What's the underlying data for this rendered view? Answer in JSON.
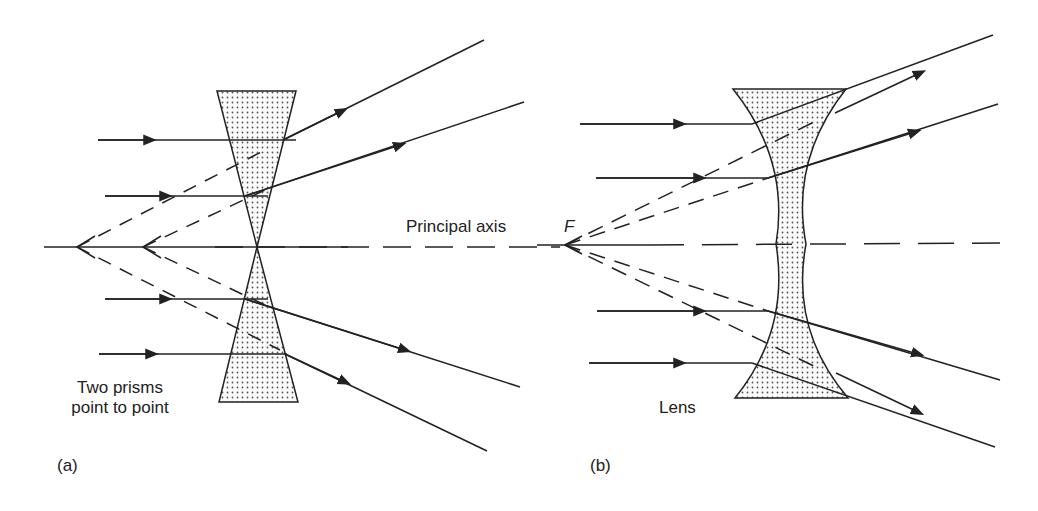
{
  "diagram": {
    "panel_a": {
      "caption": "(a)",
      "label_line1": "Two prisms",
      "label_line2": "point to point"
    },
    "panel_b": {
      "caption": "(b)",
      "label": "Lens"
    },
    "axis_label": "Principal axis",
    "focal_point_label": "F",
    "colors": {
      "line": "#222222",
      "fill_dots": "#555555",
      "background": "#ffffff"
    }
  }
}
